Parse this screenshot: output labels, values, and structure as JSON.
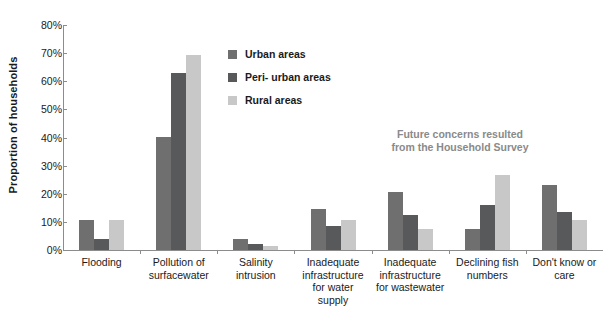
{
  "chart_data": {
    "type": "bar",
    "title": "",
    "xlabel": "",
    "ylabel": "Proportion of households",
    "ylim": [
      0,
      80
    ],
    "ytick_labels": [
      "0%",
      "10%",
      "20%",
      "30%",
      "40%",
      "50%",
      "60%",
      "70%",
      "80%"
    ],
    "ytick_values": [
      0,
      10,
      20,
      30,
      40,
      50,
      60,
      70,
      80
    ],
    "grid": false,
    "legend_position": "inside-upper-center",
    "categories": [
      "Flooding",
      "Pollution of surfacewater",
      "Salinity intrusion",
      "Inadequate infrastructure for water supply",
      "Inadequate infrastructure for wastewater",
      "Declining fish numbers",
      "Don't know or care"
    ],
    "category_lines": [
      [
        "Flooding"
      ],
      [
        "Pollution of",
        "surfacewater"
      ],
      [
        "Salinity",
        "intrusion"
      ],
      [
        "Inadequate",
        "infrastructure",
        "for water",
        "supply"
      ],
      [
        "Inadequate",
        "infrastructure",
        "for wastewater"
      ],
      [
        "Declining fish",
        "numbers"
      ],
      [
        "Don't know or",
        "care"
      ]
    ],
    "series": [
      {
        "name": "Urban areas",
        "color": "#706f6f",
        "values": [
          10.5,
          40.3,
          4.0,
          14.5,
          20.5,
          7.5,
          23.0
        ]
      },
      {
        "name": "Peri- urban areas",
        "color": "#58595b",
        "values": [
          4.0,
          63.0,
          2.0,
          8.5,
          12.5,
          16.0,
          13.5
        ]
      },
      {
        "name": "Rural areas",
        "color": "#c8c8c8",
        "values": [
          10.5,
          69.5,
          1.5,
          10.5,
          7.5,
          26.5,
          10.5
        ]
      }
    ],
    "annotations": [
      {
        "name": "future-concerns-note",
        "lines": [
          "Future concerns resulted",
          "from the Household Survey"
        ],
        "color": "#8a8a8a"
      }
    ]
  }
}
